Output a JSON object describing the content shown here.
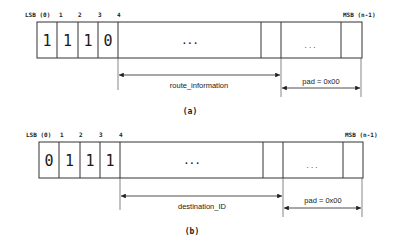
{
  "diagrams": [
    {
      "id": "a",
      "caption": "(a)",
      "lsb_label": "LSB (0)",
      "msb_label": "MSB (n-1)",
      "bit_indices": [
        "1",
        "2",
        "3",
        "4"
      ],
      "bits": [
        "1",
        "1",
        "1",
        "0"
      ],
      "ellipsis_main": ". . .",
      "ellipsis_pad": ". . .",
      "field_label": "route_information",
      "pad_label": "pad = 0x00"
    },
    {
      "id": "b",
      "caption": "(b)",
      "lsb_label": "LSB (0)",
      "msb_label": "MSB (n-1)",
      "bit_indices": [
        "1",
        "2",
        "3",
        "4"
      ],
      "bits": [
        "0",
        "1",
        "1",
        "1"
      ],
      "ellipsis_main": ". . .",
      "ellipsis_pad": ". . .",
      "field_label": "destination_ID",
      "pad_label": "pad = 0x00"
    }
  ]
}
